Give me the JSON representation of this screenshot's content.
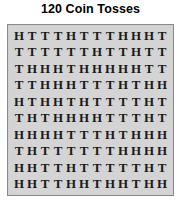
{
  "title": "120 Coin Tosses",
  "panel": {
    "background_color": "#d4d4d4",
    "border_color": "#8a8a8a"
  },
  "chart_data": {
    "type": "table",
    "title": "120 Coin Tosses",
    "xlabel": "",
    "ylabel": "",
    "rows": 10,
    "columns": 12,
    "total_tosses": 120,
    "symbols": [
      "H",
      "T"
    ],
    "grid": [
      [
        "H",
        "T",
        "T",
        "T",
        "H",
        "T",
        "T",
        "T",
        "H",
        "H",
        "H",
        "T"
      ],
      [
        "T",
        "T",
        "T",
        "T",
        "T",
        "T",
        "H",
        "T",
        "T",
        "H",
        "T",
        "T"
      ],
      [
        "T",
        "H",
        "H",
        "H",
        "T",
        "H",
        "H",
        "H",
        "H",
        "H",
        "T",
        "T"
      ],
      [
        "T",
        "T",
        "H",
        "H",
        "H",
        "T",
        "T",
        "T",
        "H",
        "T",
        "H",
        "H"
      ],
      [
        "H",
        "T",
        "H",
        "H",
        "T",
        "H",
        "T",
        "T",
        "T",
        "T",
        "H",
        "T"
      ],
      [
        "T",
        "H",
        "T",
        "H",
        "H",
        "H",
        "H",
        "T",
        "T",
        "T",
        "H",
        "T"
      ],
      [
        "H",
        "H",
        "H",
        "H",
        "T",
        "T",
        "T",
        "H",
        "T",
        "H",
        "H",
        "H"
      ],
      [
        "T",
        "H",
        "T",
        "T",
        "T",
        "T",
        "T",
        "T",
        "H",
        "H",
        "H",
        "H"
      ],
      [
        "H",
        "H",
        "T",
        "T",
        "H",
        "T",
        "T",
        "T",
        "T",
        "T",
        "H",
        "T"
      ],
      [
        "H",
        "H",
        "T",
        "T",
        "H",
        "H",
        "T",
        "H",
        "H",
        "T",
        "H",
        "H"
      ]
    ]
  }
}
